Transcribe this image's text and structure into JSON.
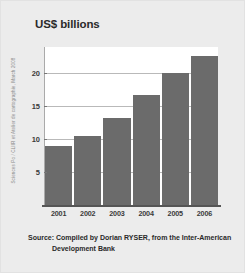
{
  "chart_data": {
    "type": "bar",
    "title": "US$ billions",
    "xlabel": "",
    "ylabel": "",
    "categories": [
      "2001",
      "2002",
      "2003",
      "2004",
      "2005",
      "2006"
    ],
    "values": [
      9.0,
      10.5,
      13.2,
      16.7,
      20.0,
      22.7
    ],
    "ylim": [
      0,
      24
    ],
    "yticks": [
      "5",
      "10",
      "15",
      "20"
    ],
    "ytick_values": [
      5,
      10,
      15,
      20
    ],
    "grid": true,
    "legend": null,
    "bar_color": "#6b6b6b",
    "gridline_color": "#b9b9b9",
    "panel_color": "#ffffff",
    "background_color": "#ececec"
  },
  "caption": {
    "line1": "Source: Compiled by Dorian RYSER, from the Inter-American",
    "line2": "Development Bank"
  },
  "credit": {
    "text": "Sciences Po / CLIIR et Atelier de cartographie, March 2008"
  }
}
